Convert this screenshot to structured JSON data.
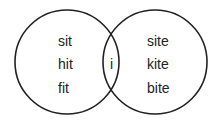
{
  "diagram": {
    "type": "venn",
    "left_set": {
      "items": [
        "sit",
        "hit",
        "fit"
      ]
    },
    "intersection": {
      "items": [
        "i"
      ]
    },
    "right_set": {
      "items": [
        "site",
        "kite",
        "bite"
      ]
    },
    "stroke_color": "#222222"
  }
}
